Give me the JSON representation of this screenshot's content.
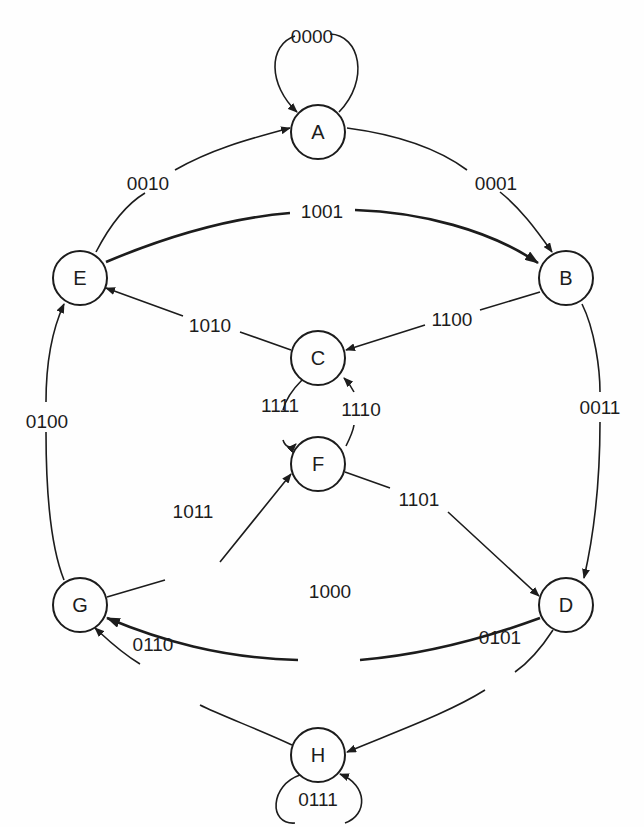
{
  "diagram": {
    "type": "state-transition-graph",
    "nodes": [
      {
        "id": "A",
        "label": "A",
        "x": 318,
        "y": 132
      },
      {
        "id": "B",
        "label": "B",
        "x": 566,
        "y": 278
      },
      {
        "id": "C",
        "label": "C",
        "x": 318,
        "y": 358
      },
      {
        "id": "D",
        "label": "D",
        "x": 566,
        "y": 605
      },
      {
        "id": "E",
        "label": "E",
        "x": 80,
        "y": 278
      },
      {
        "id": "F",
        "label": "F",
        "x": 318,
        "y": 464
      },
      {
        "id": "G",
        "label": "G",
        "x": 80,
        "y": 605
      },
      {
        "id": "H",
        "label": "H",
        "x": 318,
        "y": 755
      }
    ],
    "edges": [
      {
        "from": "A",
        "to": "A",
        "label": "0000"
      },
      {
        "from": "A",
        "to": "B",
        "label": "0001"
      },
      {
        "from": "E",
        "to": "A",
        "label": "0010"
      },
      {
        "from": "B",
        "to": "D",
        "label": "0011"
      },
      {
        "from": "G",
        "to": "E",
        "label": "0100"
      },
      {
        "from": "D",
        "to": "H",
        "label": "0101"
      },
      {
        "from": "H",
        "to": "G",
        "label": "0110"
      },
      {
        "from": "H",
        "to": "H",
        "label": "0111"
      },
      {
        "from": "D",
        "to": "G",
        "label": "1000"
      },
      {
        "from": "E",
        "to": "B",
        "label": "1001"
      },
      {
        "from": "C",
        "to": "E",
        "label": "1010"
      },
      {
        "from": "G",
        "to": "F",
        "label": "1011"
      },
      {
        "from": "B",
        "to": "C",
        "label": "1100"
      },
      {
        "from": "F",
        "to": "D",
        "label": "1101"
      },
      {
        "from": "F",
        "to": "C",
        "label": "1110"
      },
      {
        "from": "C",
        "to": "F",
        "label": "1111"
      }
    ]
  },
  "colors": {
    "stroke": "#1c1c1c",
    "background": "#fefefe"
  }
}
